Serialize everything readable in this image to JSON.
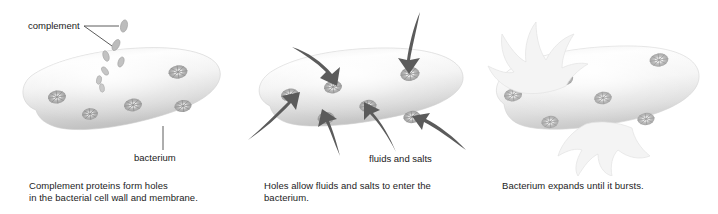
{
  "figure": {
    "background_color": "#ffffff",
    "text_color": "#1c1c1c",
    "arrow_color": "#575757",
    "cell_fill_light": "#fbfbfb",
    "cell_fill_mid": "#dcdcdc",
    "cell_fill_dark": "#c4c4c4",
    "pore_color": "#9a9a9a",
    "complement_color": "#b3b3b3",
    "splash_color": "#f2f2f2"
  },
  "panels": [
    {
      "id": "panel-1",
      "caption_line_1": "Complement proteins form holes",
      "caption_line_2": "in the bacterial cell wall and membrane.",
      "labels": {
        "complement": "complement",
        "bacterium": "bacterium"
      },
      "complement_particle_count": 7,
      "pore_count": 5
    },
    {
      "id": "panel-2",
      "caption_line_1": "Holes allow fluids and salts to enter the",
      "caption_line_2": "bacterium.",
      "labels": {
        "fluids_and_salts": "fluids and salts"
      },
      "arrow_count": 6,
      "pore_count": 6
    },
    {
      "id": "panel-3",
      "caption_line_1": "Bacterium expands until it bursts.",
      "caption_line_2": "",
      "labels": {},
      "pore_count": 6,
      "burst_count": 2
    }
  ]
}
